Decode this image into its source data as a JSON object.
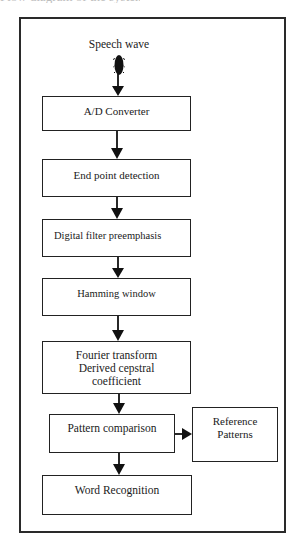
{
  "caption_fragment": "Flow diagram of the system",
  "diagram": {
    "input_label": "Speech wave",
    "input_icon": "speech-wave-icon",
    "nodes": [
      {
        "id": "ad",
        "label": "A/D Converter"
      },
      {
        "id": "endpoint",
        "label": "End point detection"
      },
      {
        "id": "filter",
        "label": "Digital filter preemphasis"
      },
      {
        "id": "hamming",
        "label": "Hamming window"
      },
      {
        "id": "fourier",
        "label": "Fourier transform\nDerived cepstral\ncoefficient"
      },
      {
        "id": "pattern",
        "label": "Pattern comparison"
      },
      {
        "id": "reference",
        "label": "Reference\nPatterns"
      },
      {
        "id": "word",
        "label": "Word Recognition"
      }
    ],
    "edges": [
      [
        "Speech wave",
        "A/D Converter"
      ],
      [
        "A/D Converter",
        "End point detection"
      ],
      [
        "End point detection",
        "Digital filter preemphasis"
      ],
      [
        "Digital filter preemphasis",
        "Hamming window"
      ],
      [
        "Hamming window",
        "Fourier transform Derived cepstral coefficient"
      ],
      [
        "Fourier transform Derived cepstral coefficient",
        "Pattern comparison"
      ],
      [
        "Pattern comparison",
        "Reference Patterns"
      ],
      [
        "Pattern comparison",
        "Word Recognition"
      ]
    ],
    "colors": {
      "stroke": "#222222",
      "background": "#ffffff"
    }
  }
}
